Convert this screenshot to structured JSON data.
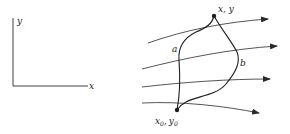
{
  "axes": {
    "x_label": "x",
    "y_label": "y"
  },
  "diagram": {
    "end_point_label": "x, y",
    "start_point": {
      "x_label": "x",
      "x_sub": "0",
      "sep": ",",
      "y_label": "y",
      "y_sub": "0"
    },
    "path_a_label": "a",
    "path_b_label": "b",
    "flow_lines": 4,
    "colors": {
      "stroke": "#2a2a2a",
      "background": "#ffffff"
    }
  }
}
